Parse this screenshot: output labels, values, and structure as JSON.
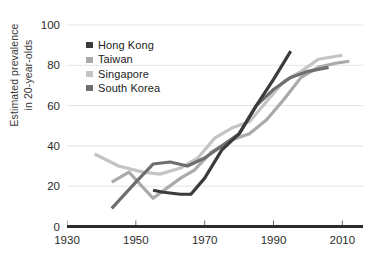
{
  "chart_data": {
    "type": "line",
    "title": "",
    "xlabel": "",
    "ylabel": "Estimated prevalence in 20-year-olds",
    "ylabel_line1": "Estimated prevalence",
    "ylabel_line2": "in 20-year-olds",
    "xlim": [
      1930,
      2016
    ],
    "ylim": [
      0,
      100
    ],
    "grid": "horizontal",
    "legend_position": "top-left inside plot",
    "y_ticks": [
      0,
      20,
      40,
      60,
      80,
      100
    ],
    "y_tick_labels": [
      "0",
      "20",
      "40",
      "60",
      "80",
      "100"
    ],
    "x_ticks": [
      1930,
      1950,
      1970,
      1990,
      2010
    ],
    "x_tick_labels": [
      "1930",
      "1950",
      "1970",
      "1990",
      "2010"
    ],
    "colors": {
      "hong_kong": "#3b3b3b",
      "taiwan": "#aaaaaa",
      "singapore": "#c4c4c4",
      "south_korea": "#6e6e6e",
      "gridline": "#e4e4e4",
      "axis": "#2b2b2b",
      "text": "#2b2b2b"
    },
    "series": [
      {
        "name": "Hong Kong",
        "color": "#3b3b3b",
        "x": [
          1955,
          1958,
          1963,
          1966,
          1970,
          1975,
          1980,
          1985,
          1990,
          1995
        ],
        "values": [
          18,
          17,
          16,
          16,
          24,
          38,
          46,
          60,
          73,
          87
        ]
      },
      {
        "name": "Taiwan",
        "color": "#aaaaaa",
        "x": [
          1943,
          1948,
          1955,
          1963,
          1967,
          1972,
          1978,
          1983,
          1988,
          1993,
          1998,
          2003,
          2008,
          2012
        ],
        "values": [
          22,
          27,
          14,
          24,
          28,
          37,
          43,
          46,
          53,
          63,
          74,
          79,
          81,
          82
        ]
      },
      {
        "name": "Singapore",
        "color": "#c4c4c4",
        "x": [
          1938,
          1945,
          1952,
          1957,
          1963,
          1968,
          1973,
          1978,
          1983,
          1988,
          1993,
          1998,
          2003,
          2010
        ],
        "values": [
          36,
          30,
          27,
          26,
          29,
          34,
          44,
          49,
          52,
          62,
          72,
          77,
          83,
          85
        ]
      },
      {
        "name": "South Korea",
        "color": "#6e6e6e",
        "x": [
          1943,
          1950,
          1955,
          1960,
          1965,
          1970,
          1975,
          1980,
          1985,
          1990,
          1995,
          2000,
          2006
        ],
        "values": [
          9,
          22,
          31,
          32,
          30,
          34,
          40,
          46,
          60,
          68,
          74,
          77,
          79
        ]
      }
    ]
  },
  "legend": {
    "items": [
      {
        "label": "Hong Kong",
        "color": "#3b3b3b"
      },
      {
        "label": "Taiwan",
        "color": "#aaaaaa"
      },
      {
        "label": "Singapore",
        "color": "#c4c4c4"
      },
      {
        "label": "South Korea",
        "color": "#6e6e6e"
      }
    ]
  }
}
